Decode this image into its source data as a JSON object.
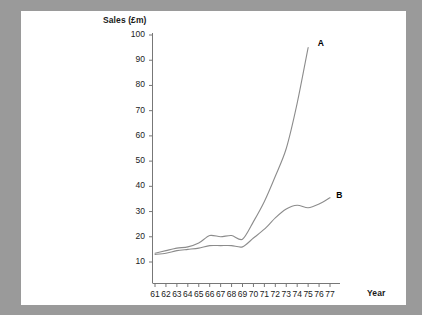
{
  "figure": {
    "background_color": "#9a9a9a",
    "plate_color": "#ffffff",
    "line_color": "#8c8c8c",
    "axis_color": "#777777",
    "text_color": "#222222"
  },
  "chart_data": {
    "type": "line",
    "title": "",
    "xlabel": "Year",
    "ylabel": "Sales (£m)",
    "xlim": [
      61,
      77
    ],
    "ylim": [
      0,
      100
    ],
    "yticks": [
      10,
      20,
      30,
      40,
      50,
      60,
      70,
      80,
      90,
      100
    ],
    "ytick_labels": [
      "10",
      "20",
      "30",
      "40",
      "50",
      "60",
      "70",
      "80",
      "90",
      "100"
    ],
    "xticks": [
      61,
      62,
      63,
      64,
      65,
      66,
      67,
      68,
      69,
      70,
      71,
      72,
      73,
      74,
      75,
      76,
      77
    ],
    "xtick_labels": [
      "61",
      "62",
      "63",
      "64",
      "65",
      "66",
      "67",
      "68",
      "69",
      "70",
      "71",
      "72",
      "73",
      "74",
      "75",
      "76",
      "77"
    ],
    "grid": false,
    "legend_position": "inline-end-of-line",
    "x": [
      61,
      62,
      63,
      64,
      65,
      66,
      67,
      68,
      69,
      70,
      71,
      72,
      73,
      74,
      75
    ],
    "series": [
      {
        "name": "A",
        "label": "A",
        "values": [
          13.5,
          14.5,
          15.5,
          16.0,
          17.5,
          20.5,
          20.0,
          20.5,
          19.0,
          26.0,
          34.0,
          44.0,
          55.0,
          73.0,
          95.0
        ]
      },
      {
        "name": "B",
        "label": "B",
        "values": [
          13.0,
          13.5,
          14.5,
          15.0,
          15.5,
          16.5,
          16.5,
          16.5,
          16.0,
          19.5,
          23.0,
          27.5,
          31.0,
          32.5,
          31.5
        ]
      }
    ],
    "series_b_tail": {
      "x": [
        75,
        76,
        77
      ],
      "values": [
        31.5,
        33.0,
        35.5
      ]
    },
    "annotations": [
      {
        "text": "A",
        "x": 75.6,
        "y": 97.0
      },
      {
        "text": "B",
        "x": 77.3,
        "y": 36.5
      }
    ]
  }
}
